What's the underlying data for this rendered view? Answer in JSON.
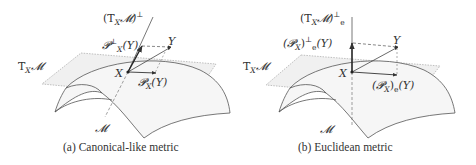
{
  "panels": [
    {
      "id": "a",
      "caption": "(a) Canonical-like metric",
      "labels": {
        "normal_space": "(T",
        "normal_space_sub": "X",
        "normal_space_mid": "𝓜)",
        "normal_space_sup": "⊥",
        "proj_perp": "𝓟",
        "proj_perp_sup": "⊥",
        "proj_perp_sub": "X",
        "proj_perp_arg": "(Y)",
        "Y": "Y",
        "tangent_space": "T",
        "tangent_space_sub": "X",
        "tangent_space_mid": "𝓜",
        "X": "X",
        "proj": "𝓟",
        "proj_sub": "X",
        "proj_arg": "(Y)",
        "manifold": "𝓜"
      }
    },
    {
      "id": "b",
      "caption": "(b) Euclidean metric",
      "labels": {
        "normal_space": "(T",
        "normal_space_sub": "X",
        "normal_space_mid": "𝓜)",
        "normal_space_sup": "⊥",
        "normal_space_subscript": "e",
        "proj_perp": "(𝓟",
        "proj_perp_sub": "X",
        "proj_perp_close": ")",
        "proj_perp_sup": "⊥",
        "proj_perp_subscript": "e",
        "proj_perp_arg": "(Y)",
        "Y": "Y",
        "tangent_space": "T",
        "tangent_space_sub": "X",
        "tangent_space_mid": "𝓜",
        "X": "X",
        "proj": "(𝓟",
        "proj_sub": "X",
        "proj_close": ")",
        "proj_subscript": "e",
        "proj_arg": "(Y)",
        "manifold": "𝓜"
      }
    }
  ],
  "colors": {
    "line": "#444444",
    "plane_fill": "#eeeeee",
    "text": "#333333"
  }
}
